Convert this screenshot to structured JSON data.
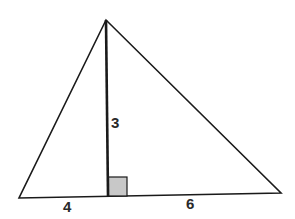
{
  "diagram": {
    "type": "triangle-with-altitude",
    "colors": {
      "stroke": "#1a1a1a",
      "right_angle_fill": "#c8c8c8",
      "background": "#ffffff"
    },
    "labels": {
      "altitude": "3",
      "left_base_segment": "4",
      "right_base_segment": "6"
    }
  }
}
